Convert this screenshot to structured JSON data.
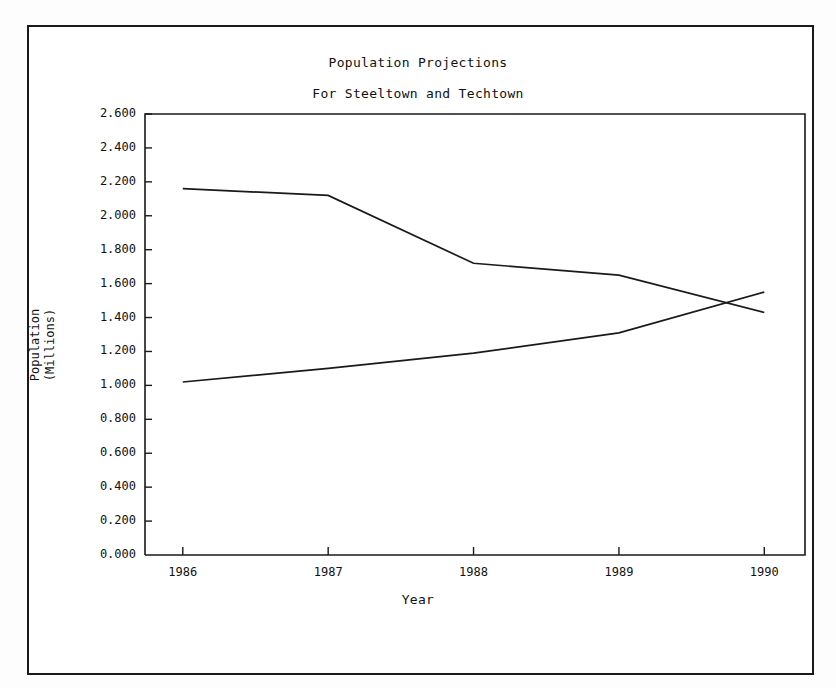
{
  "chart_data": {
    "type": "line",
    "title": "Population Projections",
    "subtitle": "For Steeltown and Techtown",
    "xlabel": "Year",
    "ylabel": "Population\n(Millions)",
    "grid": false,
    "legend": "none",
    "x": [
      1986,
      1987,
      1988,
      1989,
      1990
    ],
    "xlim": [
      1985.74,
      1990.28
    ],
    "ylim": [
      0.0,
      2.6
    ],
    "xticks": [
      "1986",
      "1987",
      "1988",
      "1989",
      "1990"
    ],
    "yticks": [
      "0.000",
      "0.200",
      "0.400",
      "0.600",
      "0.800",
      "1.000",
      "1.200",
      "1.400",
      "1.600",
      "1.800",
      "2.000",
      "2.200",
      "2.400",
      "2.600"
    ],
    "ytick_values": [
      0.0,
      0.2,
      0.4,
      0.6,
      0.8,
      1.0,
      1.2,
      1.4,
      1.6,
      1.8,
      2.0,
      2.2,
      2.4,
      2.6
    ],
    "series": [
      {
        "name": "Steeltown",
        "values": [
          2.16,
          2.12,
          1.72,
          1.65,
          1.43
        ]
      },
      {
        "name": "Techtown",
        "values": [
          1.02,
          1.1,
          1.19,
          1.31,
          1.55
        ]
      }
    ],
    "line_color": "#1a1a1a",
    "axis_color": "#1a1a1a",
    "background": "#ffffff"
  }
}
